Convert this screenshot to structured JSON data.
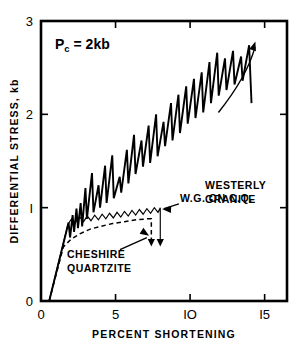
{
  "figure": {
    "background_color": "#ffffff",
    "ink_color": "#000000"
  },
  "chart_data": {
    "type": "line",
    "title": "",
    "xlabel": "PERCENT SHORTENING",
    "ylabel": "DIFFERENTIAL STRESS, kb",
    "xlim": [
      0,
      16.5
    ],
    "ylim": [
      0,
      3
    ],
    "xticks": [
      0,
      5,
      10,
      15
    ],
    "xticklabels": [
      "0",
      "5",
      "IO",
      "I5"
    ],
    "yticks": [
      0,
      1,
      2,
      3
    ],
    "yticklabels": [
      "0",
      "I",
      "2",
      "3"
    ],
    "grid": false,
    "legend_position": "inline-annotations",
    "annotations": [
      {
        "name": "confining-pressure",
        "text": "P",
        "subscript": "c",
        "tail": "= 2kb",
        "x": 1.6,
        "y": 2.72
      },
      {
        "name": "westerly-granite-label",
        "lines": [
          "WESTERLY",
          "GRANITE"
        ],
        "x": 11.6,
        "y": 1.95
      },
      {
        "name": "wg-on-cq-label",
        "lines": [
          "W.G. ON C.Q."
        ],
        "x": 9.4,
        "y": 1.08
      },
      {
        "name": "cheshire-quartzite-label",
        "lines": [
          "CHESHIRE",
          "QUARTZITE"
        ],
        "x": 2.6,
        "y": 0.52
      }
    ],
    "series": [
      {
        "name": "Westerly granite",
        "label": "WESTERLY GRANITE",
        "style": "solid-sawtooth",
        "description": "Stick-slip sawtooth stress drops rising from 0.85 kb to 2.75 kb",
        "points": [
          [
            0.55,
            0.0
          ],
          [
            1.85,
            0.84
          ],
          [
            1.95,
            0.68
          ],
          [
            2.12,
            0.92
          ],
          [
            2.22,
            0.74
          ],
          [
            2.38,
            0.99
          ],
          [
            2.48,
            0.78
          ],
          [
            2.66,
            1.05
          ],
          [
            2.76,
            0.8
          ],
          [
            2.98,
            1.21
          ],
          [
            3.08,
            0.88
          ],
          [
            3.42,
            1.37
          ],
          [
            3.52,
            0.95
          ],
          [
            3.86,
            1.24
          ],
          [
            3.96,
            1.0
          ],
          [
            4.3,
            1.45
          ],
          [
            4.4,
            1.05
          ],
          [
            4.78,
            1.56
          ],
          [
            4.88,
            1.1
          ],
          [
            5.28,
            1.33
          ],
          [
            5.38,
            1.16
          ],
          [
            5.76,
            1.62
          ],
          [
            5.86,
            1.26
          ],
          [
            6.24,
            1.78
          ],
          [
            6.34,
            1.36
          ],
          [
            6.74,
            1.72
          ],
          [
            6.84,
            1.44
          ],
          [
            7.22,
            1.88
          ],
          [
            7.32,
            1.48
          ],
          [
            7.72,
            2.0
          ],
          [
            7.82,
            1.55
          ],
          [
            8.22,
            1.92
          ],
          [
            8.32,
            1.66
          ],
          [
            8.72,
            2.12
          ],
          [
            8.82,
            1.72
          ],
          [
            9.22,
            2.21
          ],
          [
            9.32,
            1.8
          ],
          [
            9.74,
            2.3
          ],
          [
            9.84,
            1.9
          ],
          [
            10.26,
            2.38
          ],
          [
            10.36,
            1.96
          ],
          [
            10.78,
            2.45
          ],
          [
            10.88,
            2.02
          ],
          [
            11.3,
            2.56
          ],
          [
            11.4,
            2.12
          ],
          [
            11.82,
            2.66
          ],
          [
            11.92,
            2.2
          ],
          [
            12.34,
            2.6
          ],
          [
            12.44,
            2.26
          ],
          [
            12.88,
            2.68
          ],
          [
            12.98,
            2.32
          ],
          [
            13.42,
            2.62
          ],
          [
            13.52,
            2.36
          ],
          [
            13.96,
            2.74
          ],
          [
            14.06,
            2.35
          ],
          [
            14.12,
            2.12
          ]
        ]
      },
      {
        "name": "Westerly granite on Cheshire quartzite",
        "label": "W.G. ON C.Q.",
        "style": "solid-fine-sawtooth",
        "description": "Fine-toothed frictional sliding sawtooth near 0.9-1.0 kb, terminating with a stress drop at 8 percent",
        "points": [
          [
            0.55,
            0.0
          ],
          [
            1.8,
            0.82
          ],
          [
            2.05,
            0.88
          ],
          [
            2.3,
            0.84
          ],
          [
            2.6,
            0.9
          ],
          [
            2.85,
            0.85
          ],
          [
            3.1,
            0.91
          ],
          [
            3.35,
            0.86
          ],
          [
            3.6,
            0.92
          ],
          [
            3.85,
            0.87
          ],
          [
            4.1,
            0.93
          ],
          [
            4.35,
            0.88
          ],
          [
            4.6,
            0.94
          ],
          [
            4.85,
            0.89
          ],
          [
            5.1,
            0.95
          ],
          [
            5.35,
            0.9
          ],
          [
            5.6,
            0.96
          ],
          [
            5.85,
            0.91
          ],
          [
            6.1,
            0.97
          ],
          [
            6.35,
            0.92
          ],
          [
            6.6,
            0.98
          ],
          [
            6.85,
            0.93
          ],
          [
            7.1,
            0.99
          ],
          [
            7.35,
            0.94
          ],
          [
            7.6,
            1.0
          ],
          [
            7.85,
            0.95
          ],
          [
            8.0,
            1.0
          ],
          [
            8.0,
            0.62
          ]
        ],
        "terminal_arrow": {
          "x": 8.0,
          "y_from": 0.98,
          "y_to": 0.6
        }
      },
      {
        "name": "Cheshire quartzite",
        "label": "CHESHIRE QUARTZITE",
        "style": "dashed",
        "description": "Smooth ductile work-hardening curve rising to 0.88 kb, ending with a stress drop at 7.4 percent",
        "points": [
          [
            0.55,
            0.0
          ],
          [
            1.5,
            0.58
          ],
          [
            2.0,
            0.66
          ],
          [
            2.6,
            0.72
          ],
          [
            3.3,
            0.77
          ],
          [
            4.0,
            0.8
          ],
          [
            4.8,
            0.83
          ],
          [
            5.6,
            0.85
          ],
          [
            6.4,
            0.87
          ],
          [
            7.1,
            0.88
          ],
          [
            7.4,
            0.88
          ],
          [
            7.4,
            0.62
          ]
        ],
        "terminal_arrow": {
          "x": 7.4,
          "y_from": 0.86,
          "y_to": 0.6
        }
      }
    ]
  }
}
